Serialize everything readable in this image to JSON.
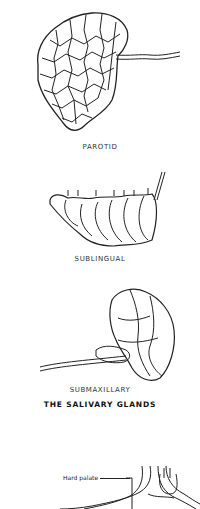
{
  "figure": {
    "title": "THE SALIVARY GLANDS",
    "glands": [
      {
        "name": "parotid",
        "label": "PAROTID"
      },
      {
        "name": "sublingual",
        "label": "SUBLINGUAL"
      },
      {
        "name": "submaxillary",
        "label": "SUBMAXILLARY"
      }
    ],
    "next_figure": {
      "labels": [
        "Hard palate"
      ]
    }
  },
  "colors": {
    "ink": "#222222",
    "background": "#ffffff"
  }
}
